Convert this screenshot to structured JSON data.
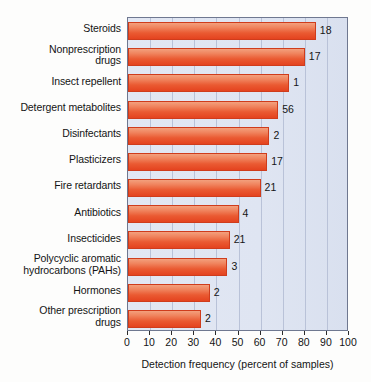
{
  "chart_data": {
    "type": "bar",
    "orientation": "horizontal",
    "title": "",
    "xlabel": "Detection frequency (percent of samples)",
    "ylabel": "",
    "xlim": [
      0,
      100
    ],
    "xticks": [
      0,
      10,
      20,
      30,
      40,
      50,
      60,
      70,
      80,
      90,
      100
    ],
    "grid": true,
    "legend": null,
    "categories": [
      "Steroids",
      "Nonprescription drugs",
      "Insect repellent",
      "Detergent metabolites",
      "Disinfectants",
      "Plasticizers",
      "Fire retardants",
      "Antibiotics",
      "Insecticides",
      "Polycyclic aromatic hydrocarbons (PAHs)",
      "Hormones",
      "Other prescription drugs"
    ],
    "values": [
      85,
      80,
      73,
      68,
      64,
      63,
      60,
      50,
      46,
      45,
      37,
      33
    ],
    "point_labels": [
      "18",
      "17",
      "1",
      "56",
      "2",
      "17",
      "21",
      "4",
      "21",
      "3",
      "2",
      "2"
    ],
    "colors": {
      "bar_top": "#f3a07d",
      "bar_bottom": "#e4431f",
      "bar_border": "#cf3c1c",
      "plot_background": "#dfe5f2",
      "gridline": "#b9c2d8",
      "axis": "#6f7890",
      "text": "#141414",
      "page_background": "#fdfdfc"
    }
  },
  "labels": {
    "rows": [
      {
        "lines": [
          "Steroids"
        ]
      },
      {
        "lines": [
          "Nonprescription",
          "drugs"
        ]
      },
      {
        "lines": [
          "Insect repellent"
        ]
      },
      {
        "lines": [
          "Detergent metabolites"
        ]
      },
      {
        "lines": [
          "Disinfectants"
        ]
      },
      {
        "lines": [
          "Plasticizers"
        ]
      },
      {
        "lines": [
          "Fire retardants"
        ]
      },
      {
        "lines": [
          "Antibiotics"
        ]
      },
      {
        "lines": [
          "Insecticides"
        ]
      },
      {
        "lines": [
          "Polycyclic aromatic",
          "hydrocarbons (PAHs)"
        ]
      },
      {
        "lines": [
          "Hormones"
        ]
      },
      {
        "lines": [
          "Other prescription",
          "drugs"
        ]
      }
    ]
  }
}
